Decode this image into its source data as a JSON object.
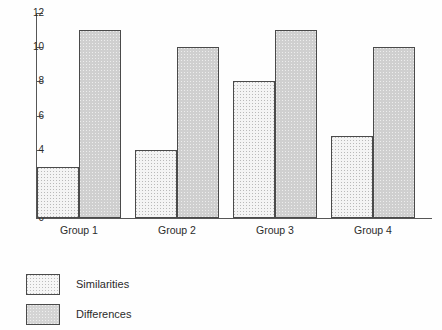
{
  "chart_data": {
    "type": "bar",
    "title": "",
    "subtitle": "",
    "xlabel": "",
    "ylabel": "",
    "categories": [
      "Group 1",
      "Group 2",
      "Group 3",
      "Group 4"
    ],
    "series": [
      {
        "name": "Similarities",
        "values": [
          3,
          4,
          8,
          4.8
        ],
        "fill": "light-dotted",
        "color": "#f4f4f4"
      },
      {
        "name": "Differences",
        "values": [
          11,
          10,
          11,
          10
        ],
        "fill": "gray-dotted",
        "color": "#cfcfcf"
      }
    ],
    "ylim": [
      0,
      12
    ],
    "yticks": [
      0,
      2,
      4,
      6,
      8,
      10,
      12
    ],
    "ytick_labels": [
      "0",
      "2",
      "4",
      "6",
      "8",
      "10",
      "12"
    ],
    "grid": false,
    "legend_position": "below-left",
    "annotations": []
  },
  "axes": {
    "y_ticks": [
      {
        "value": 12,
        "label": "12"
      },
      {
        "value": 10,
        "label": "10"
      },
      {
        "value": 8,
        "label": "8"
      },
      {
        "value": 6,
        "label": "6"
      },
      {
        "value": 4,
        "label": "4"
      },
      {
        "value": 2,
        "label": "2"
      },
      {
        "value": 0,
        "label": "0"
      }
    ]
  },
  "groups": [
    {
      "label": "Group 1",
      "similarities": 3,
      "differences": 11
    },
    {
      "label": "Group 2",
      "similarities": 4,
      "differences": 10
    },
    {
      "label": "Group 3",
      "similarities": 8,
      "differences": 11
    },
    {
      "label": "Group 4",
      "similarities": 4.8,
      "differences": 10
    }
  ],
  "legend": {
    "items": [
      {
        "label": "Similarities",
        "key": "similarities"
      },
      {
        "label": "Differences",
        "key": "differences"
      }
    ]
  }
}
